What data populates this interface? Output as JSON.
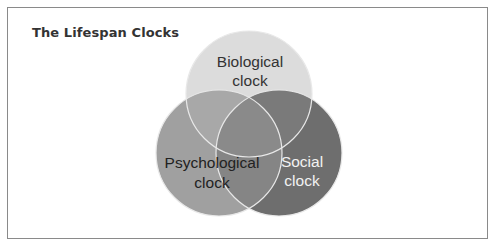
{
  "title": "The Lifespan Clocks",
  "diagram": {
    "type": "venn",
    "circles": [
      {
        "id": "biological",
        "label_line1": "Biological",
        "label_line2": "clock",
        "fill": "#dcdcdc",
        "text_color": "#333333"
      },
      {
        "id": "psychological",
        "label_line1": "Psychological",
        "label_line2": "clock",
        "fill": "#a0a0a0",
        "text_color": "#222222"
      },
      {
        "id": "social",
        "label_line1": "Social",
        "label_line2": "clock",
        "fill": "#6e6e6e",
        "text_color": "#f2f2f2"
      }
    ],
    "overlap_colors": {
      "biological_psychological": "#a8a8a8",
      "biological_social": "#7a7a7a",
      "psychological_social": "#858585",
      "all": "#8a8a8a"
    },
    "outline_color": "#e8e8e8"
  }
}
